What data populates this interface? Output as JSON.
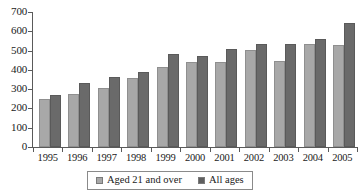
{
  "chart_data": {
    "type": "bar",
    "title": "",
    "subtitle": "",
    "xlabel": "",
    "ylabel": "",
    "ylim": [
      0,
      700
    ],
    "ytick_step": 100,
    "grid": false,
    "legend_position": "bottom",
    "categories": [
      "1995",
      "1996",
      "1997",
      "1998",
      "1999",
      "2000",
      "2001",
      "2002",
      "2003",
      "2004",
      "2005"
    ],
    "ytick_labels": [
      "700",
      "600",
      "500",
      "400",
      "300",
      "200",
      "100",
      "0"
    ],
    "series": [
      {
        "name": "Aged 21 and over",
        "color": "#a8a8a8",
        "values": [
          248,
          276,
          305,
          358,
          415,
          440,
          443,
          503,
          446,
          534,
          528
        ]
      },
      {
        "name": "All ages",
        "color": "#6a6a6a",
        "values": [
          270,
          330,
          363,
          389,
          482,
          472,
          508,
          534,
          534,
          560,
          643
        ]
      }
    ]
  },
  "legend": {
    "items": [
      {
        "label": "Aged 21 and over",
        "swatch": "light"
      },
      {
        "label": "All ages",
        "swatch": "dark"
      }
    ]
  }
}
